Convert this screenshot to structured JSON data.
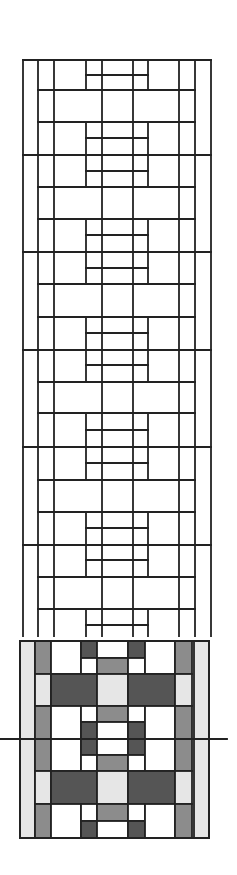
{
  "diagram": {
    "stroke_color": "#222222",
    "colors": {
      "white": "#ffffff",
      "light": "#e6e6e6",
      "mid": "#8c8c8c",
      "dark": "#555555"
    },
    "line_drawing": {
      "outer_x": [
        23,
        211
      ],
      "outer_y_top": 60,
      "y_bottom": 636,
      "full_cols_x": [
        23,
        38,
        54,
        179,
        195,
        211
      ],
      "center_cols_x": [
        102,
        133
      ],
      "inner_cols_x": [
        86,
        148
      ],
      "full_rows_y": [
        60,
        155,
        252,
        350,
        447,
        545
      ],
      "mid_rows_y": [
        90,
        122,
        187,
        219,
        284,
        317,
        382,
        413,
        480,
        512,
        577,
        609
      ],
      "mid_row_span": [
        38,
        195
      ],
      "inner_rows_y": [
        75,
        138,
        171,
        235,
        268,
        333,
        365,
        430,
        463,
        528,
        560,
        625
      ],
      "inner_row_span": [
        86,
        148
      ],
      "inner_blocks_y": [
        [
          60,
          90
        ],
        [
          122,
          187
        ],
        [
          219,
          284
        ],
        [
          317,
          382
        ],
        [
          413,
          480
        ],
        [
          512,
          577
        ],
        [
          609,
          636
        ]
      ]
    },
    "shaded_panel": {
      "x": [
        20,
        35,
        51,
        81,
        97,
        128,
        145,
        175,
        192,
        209
      ],
      "y_top": 641,
      "y_bottom": 838,
      "cells": [
        {
          "x": 20,
          "y": 641,
          "w": 15,
          "h": 197,
          "fill": "light"
        },
        {
          "x": 194,
          "y": 641,
          "w": 15,
          "h": 197,
          "fill": "light"
        },
        {
          "x": 35,
          "y": 641,
          "w": 16,
          "h": 33,
          "fill": "mid"
        },
        {
          "x": 51,
          "y": 641,
          "w": 30,
          "h": 33,
          "fill": "white"
        },
        {
          "x": 81,
          "y": 641,
          "w": 16,
          "h": 17,
          "fill": "dark"
        },
        {
          "x": 97,
          "y": 641,
          "w": 31,
          "h": 17,
          "fill": "white"
        },
        {
          "x": 128,
          "y": 641,
          "w": 17,
          "h": 17,
          "fill": "dark"
        },
        {
          "x": 81,
          "y": 658,
          "w": 16,
          "h": 16,
          "fill": "white"
        },
        {
          "x": 97,
          "y": 658,
          "w": 31,
          "h": 16,
          "fill": "mid"
        },
        {
          "x": 128,
          "y": 658,
          "w": 17,
          "h": 16,
          "fill": "white"
        },
        {
          "x": 145,
          "y": 641,
          "w": 30,
          "h": 33,
          "fill": "white"
        },
        {
          "x": 175,
          "y": 641,
          "w": 17,
          "h": 33,
          "fill": "mid"
        },
        {
          "x": 35,
          "y": 674,
          "w": 16,
          "h": 32,
          "fill": "light"
        },
        {
          "x": 51,
          "y": 674,
          "w": 46,
          "h": 32,
          "fill": "dark"
        },
        {
          "x": 97,
          "y": 674,
          "w": 31,
          "h": 32,
          "fill": "light"
        },
        {
          "x": 128,
          "y": 674,
          "w": 47,
          "h": 32,
          "fill": "dark"
        },
        {
          "x": 175,
          "y": 674,
          "w": 17,
          "h": 32,
          "fill": "light"
        },
        {
          "x": 35,
          "y": 706,
          "w": 16,
          "h": 65,
          "fill": "mid"
        },
        {
          "x": 51,
          "y": 706,
          "w": 30,
          "h": 65,
          "fill": "white"
        },
        {
          "x": 81,
          "y": 706,
          "w": 16,
          "h": 16,
          "fill": "white"
        },
        {
          "x": 97,
          "y": 706,
          "w": 31,
          "h": 16,
          "fill": "mid"
        },
        {
          "x": 128,
          "y": 706,
          "w": 17,
          "h": 16,
          "fill": "white"
        },
        {
          "x": 81,
          "y": 722,
          "w": 16,
          "h": 33,
          "fill": "dark"
        },
        {
          "x": 97,
          "y": 722,
          "w": 31,
          "h": 33,
          "fill": "white"
        },
        {
          "x": 128,
          "y": 722,
          "w": 17,
          "h": 33,
          "fill": "dark"
        },
        {
          "x": 81,
          "y": 755,
          "w": 16,
          "h": 16,
          "fill": "white"
        },
        {
          "x": 97,
          "y": 755,
          "w": 31,
          "h": 16,
          "fill": "mid"
        },
        {
          "x": 128,
          "y": 755,
          "w": 17,
          "h": 16,
          "fill": "white"
        },
        {
          "x": 145,
          "y": 706,
          "w": 30,
          "h": 65,
          "fill": "white"
        },
        {
          "x": 175,
          "y": 706,
          "w": 17,
          "h": 65,
          "fill": "mid"
        },
        {
          "x": 35,
          "y": 771,
          "w": 16,
          "h": 33,
          "fill": "light"
        },
        {
          "x": 51,
          "y": 771,
          "w": 46,
          "h": 33,
          "fill": "dark"
        },
        {
          "x": 97,
          "y": 771,
          "w": 31,
          "h": 33,
          "fill": "light"
        },
        {
          "x": 128,
          "y": 771,
          "w": 47,
          "h": 33,
          "fill": "dark"
        },
        {
          "x": 175,
          "y": 771,
          "w": 17,
          "h": 33,
          "fill": "light"
        },
        {
          "x": 35,
          "y": 804,
          "w": 16,
          "h": 34,
          "fill": "mid"
        },
        {
          "x": 51,
          "y": 804,
          "w": 30,
          "h": 34,
          "fill": "white"
        },
        {
          "x": 81,
          "y": 804,
          "w": 16,
          "h": 17,
          "fill": "white"
        },
        {
          "x": 97,
          "y": 804,
          "w": 31,
          "h": 17,
          "fill": "mid"
        },
        {
          "x": 128,
          "y": 804,
          "w": 17,
          "h": 17,
          "fill": "white"
        },
        {
          "x": 81,
          "y": 821,
          "w": 16,
          "h": 17,
          "fill": "dark"
        },
        {
          "x": 97,
          "y": 821,
          "w": 31,
          "h": 17,
          "fill": "white"
        },
        {
          "x": 128,
          "y": 821,
          "w": 17,
          "h": 17,
          "fill": "dark"
        },
        {
          "x": 145,
          "y": 804,
          "w": 30,
          "h": 34,
          "fill": "white"
        },
        {
          "x": 175,
          "y": 804,
          "w": 17,
          "h": 34,
          "fill": "mid"
        }
      ]
    },
    "axis_line": {
      "y": 739,
      "x1": 0,
      "x2": 227
    }
  }
}
